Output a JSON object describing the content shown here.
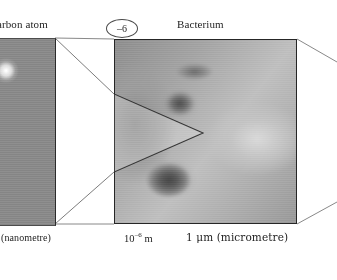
{
  "figure": {
    "type": "powers-of-ten scale comparison figure",
    "exponent_badge": "–6",
    "labels": {
      "left_panel_title": "arbon atom",
      "center_panel_title": "Bacterium",
      "left_scale_caption": "(nanometre)",
      "center_scale_mantissa": "10",
      "center_scale_exponent": "–6",
      "center_scale_unit": "m",
      "right_scale_caption": "1 μm (micrometre)"
    },
    "panels": [
      {
        "name": "carbon-atom-image",
        "title": "arbon atom",
        "caption": "(nanometre)",
        "description": "Scanning tunnelling micrograph of carbon atoms as bright round blobs on grey background",
        "clipped": true
      },
      {
        "name": "bacterium-image",
        "title": "Bacterium",
        "caption": "1 μm (micrometre)",
        "scale_notation": "10⁻⁶ m",
        "description": "Grey micrograph of a bacterium with dark rounded cell bodies and a bright diagonal highlight"
      }
    ],
    "colors": {
      "background": "#ffffff",
      "frame_stroke": "#262626",
      "connector_stroke": "#4a4a4a",
      "text": "#232323",
      "image_mid_grey": "#a8a8a8"
    }
  }
}
